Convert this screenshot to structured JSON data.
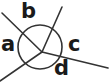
{
  "figure": {
    "name": "angle-diagram-with-circle",
    "width": 110,
    "height": 83,
    "background_color": "#ffffff",
    "stroke_color": "#333333",
    "label_color": "#1a1a1a"
  },
  "labels": {
    "a": "a",
    "b": "b",
    "c": "c",
    "d": "d"
  },
  "chart_data": {
    "type": "diagram",
    "title": "",
    "circle": {
      "cx": 40,
      "cy": 47,
      "r": 22,
      "stroke": "#333333",
      "stroke_width": 1.6,
      "fill": "none"
    },
    "vertex": {
      "x": 42,
      "y": 52
    },
    "rays": [
      {
        "label": "a",
        "from": [
          42,
          52
        ],
        "to": [
          2,
          13
        ],
        "label_pos": [
          1,
          34
        ]
      },
      {
        "label": "b",
        "from": [
          42,
          52
        ],
        "to": [
          62,
          7
        ],
        "label_pos": [
          21,
          1
        ]
      },
      {
        "label": "c",
        "from": [
          42,
          52
        ],
        "to": [
          108,
          68
        ],
        "label_pos": [
          68,
          34
        ]
      },
      {
        "label": "d",
        "from": [
          42,
          52
        ],
        "to": [
          0,
          81
        ],
        "label_pos": [
          54,
          58
        ]
      }
    ]
  }
}
